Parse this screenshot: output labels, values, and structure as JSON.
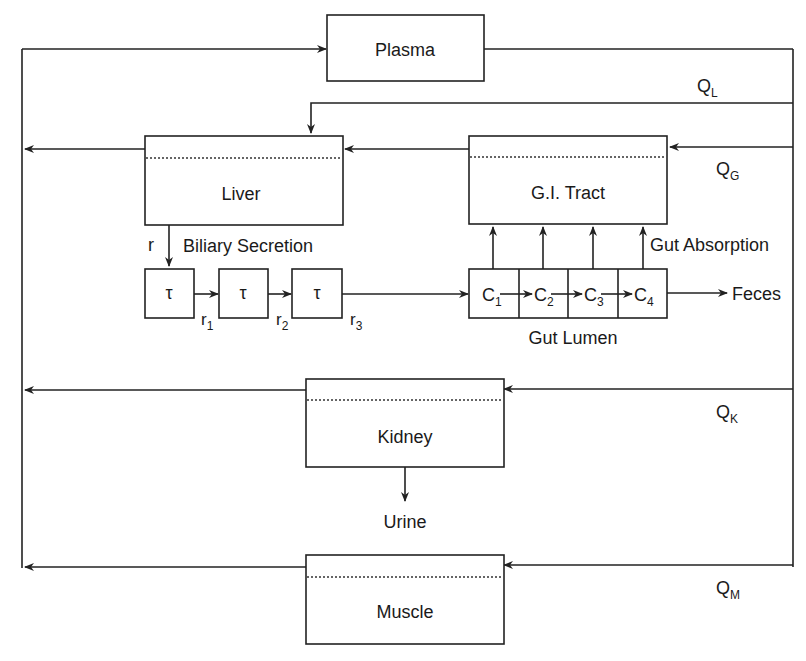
{
  "diagram": {
    "type": "PBPK compartment model flow diagram",
    "compartments": {
      "plasma": "Plasma",
      "liver": "Liver",
      "gi_tract": "G.I. Tract",
      "kidney": "Kidney",
      "muscle": "Muscle"
    },
    "flows": {
      "q_l": {
        "base": "Q",
        "sub": "L"
      },
      "q_g": {
        "base": "Q",
        "sub": "G"
      },
      "q_k": {
        "base": "Q",
        "sub": "K"
      },
      "q_m": {
        "base": "Q",
        "sub": "M"
      }
    },
    "biliary": {
      "label": "Biliary Secretion",
      "rate_in": "r",
      "delays": [
        "τ",
        "τ",
        "τ"
      ],
      "rates": [
        {
          "base": "r",
          "sub": "1"
        },
        {
          "base": "r",
          "sub": "2"
        },
        {
          "base": "r",
          "sub": "3"
        }
      ]
    },
    "gut_lumen": {
      "label": "Gut Lumen",
      "absorption_label": "Gut Absorption",
      "segments": [
        {
          "base": "C",
          "sub": "1"
        },
        {
          "base": "C",
          "sub": "2"
        },
        {
          "base": "C",
          "sub": "3"
        },
        {
          "base": "C",
          "sub": "4"
        }
      ],
      "output": "Feces"
    },
    "kidney_output": "Urine"
  }
}
